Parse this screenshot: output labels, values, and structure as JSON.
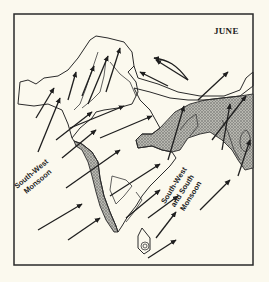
{
  "map": {
    "title": "JUNE",
    "region": "South Asia (Indian subcontinent)",
    "labels": {
      "southwest_monsoon": {
        "line1": "South-West",
        "line2": "Monsoon"
      },
      "southwest_south_monsoon": {
        "line1": "South-West",
        "line2": "and South",
        "line3": "Monsoon"
      }
    },
    "colors": {
      "background": "#fbf9ee",
      "ink": "#2a2a2a",
      "shading": "#8a8a8a"
    },
    "features": [
      "frame-border",
      "landmass-outline",
      "stippled-high-rainfall-areas",
      "wind-direction-arrows",
      "sri-lanka"
    ]
  }
}
